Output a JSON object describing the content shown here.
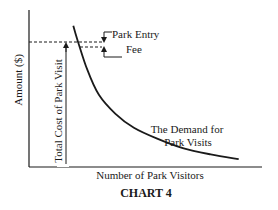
{
  "chart_data": {
    "type": "line",
    "title": "CHART 4",
    "xlabel": "Number of Park Visitors",
    "ylabel": "Amount ($)",
    "grid": false,
    "series": [
      {
        "name": "The Demand for Park Visits",
        "description": "Downward-sloping convex demand curve",
        "x": [
          0.19,
          0.21,
          0.25,
          0.3,
          0.37,
          0.45,
          0.55,
          0.66,
          0.78,
          0.9
        ],
        "y": [
          0.9,
          0.8,
          0.62,
          0.46,
          0.34,
          0.25,
          0.18,
          0.12,
          0.08,
          0.05
        ]
      }
    ],
    "xlim": [
      0,
      1
    ],
    "ylim": [
      0,
      1
    ],
    "annotations": {
      "curve_label_line1": "The Demand for",
      "curve_label_line2": "Park Visits",
      "fee_label_line1": "Park Entry",
      "fee_label_line2": "Fee",
      "total_cost_label": "Total Cost of Park Visit",
      "upper_price_level": 0.8,
      "lower_price_level": 0.77
    }
  }
}
